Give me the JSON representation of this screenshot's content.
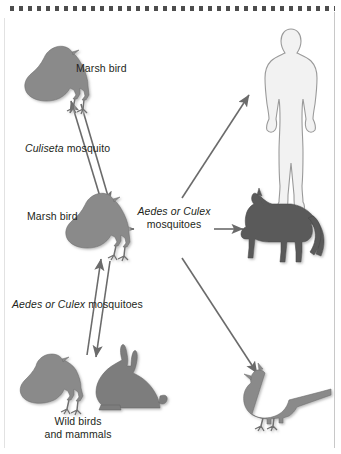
{
  "figure": {
    "border_color": "#4d4d4d",
    "arrow_color": "#6b6b6b",
    "silhouette_gray": "#8a8a8a",
    "silhouette_dark": "#5a5a5a",
    "human_fill": "#f2f2f2",
    "human_stroke": "#9a9a9a"
  },
  "labels": {
    "marsh_bird_top": "Marsh bird",
    "marsh_bird_mid": "Marsh bird",
    "culiseta_italic": "Culiseta",
    "culiseta_rest": " mosquito",
    "aedes_culex_italic": "Aedes or Culex",
    "aedes_mid_rest": "mosquitoes",
    "aedes_low_rest": " mosquitoes",
    "wild_line1": "Wild birds",
    "wild_line2": "and mammals"
  },
  "nodes": [
    {
      "id": "marsh-bird-top",
      "name": "marsh-bird-top",
      "type": "bird-silhouette",
      "label": "Marsh bird"
    },
    {
      "id": "marsh-bird-mid",
      "name": "marsh-bird-middle",
      "type": "bird-silhouette",
      "label": "Marsh bird"
    },
    {
      "id": "wild-bird",
      "name": "wild-bird",
      "type": "bird-silhouette",
      "label": "Wild birds"
    },
    {
      "id": "rabbit",
      "name": "rabbit",
      "type": "mammal-silhouette",
      "label": "and mammals"
    },
    {
      "id": "human",
      "name": "human-figure",
      "type": "human-silhouette",
      "label": ""
    },
    {
      "id": "horse",
      "name": "horse",
      "type": "horse-silhouette",
      "label": ""
    },
    {
      "id": "pheasant",
      "name": "pheasant",
      "type": "pheasant-silhouette",
      "label": ""
    }
  ],
  "edges": [
    {
      "from": "marsh-bird-mid",
      "to": "marsh-bird-top",
      "vector": "Culiseta mosquito",
      "bidirectional": true
    },
    {
      "from": "wild-bird",
      "to": "marsh-bird-mid",
      "vector": "Aedes or Culex mosquitoes",
      "bidirectional": true
    },
    {
      "from": "marsh-bird-mid",
      "to": "human",
      "vector": "Aedes or Culex mosquitoes",
      "bidirectional": false
    },
    {
      "from": "marsh-bird-mid",
      "to": "horse",
      "vector": "Aedes or Culex mosquitoes",
      "bidirectional": false
    },
    {
      "from": "marsh-bird-mid",
      "to": "pheasant",
      "vector": "Aedes or Culex mosquitoes",
      "bidirectional": false
    }
  ]
}
